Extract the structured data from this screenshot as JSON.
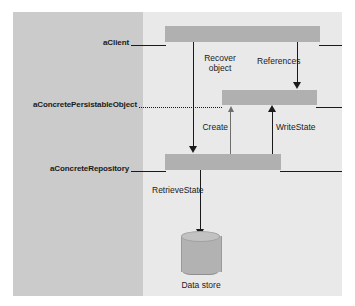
{
  "figure": {
    "kind": "uml-sequence-diagram",
    "background_color": "#ffffff",
    "canvas_color": "#e9e9e9",
    "label_panel_color": "#cbcbcb",
    "activation_color": "#b0b0b0",
    "line_color": "#1a1a1a"
  },
  "participants": [
    {
      "label": "aClient",
      "lifeline_style": "solid"
    },
    {
      "label": "aConcretePersistableObject",
      "lifeline_style": "dotted"
    },
    {
      "label": "aConcreteRepository",
      "lifeline_style": "solid"
    }
  ],
  "messages": [
    {
      "label": "Recover object",
      "direction": "down",
      "weight": "normal"
    },
    {
      "label": "References",
      "direction": "down",
      "weight": "normal"
    },
    {
      "label": "Create",
      "direction": "up",
      "weight": "thin"
    },
    {
      "label": "WriteState",
      "direction": "up",
      "weight": "normal"
    },
    {
      "label": "RetrieveState",
      "direction": "down",
      "weight": "normal"
    }
  ],
  "data_store": {
    "caption": "Data store",
    "shape": "cylinder-icon"
  }
}
